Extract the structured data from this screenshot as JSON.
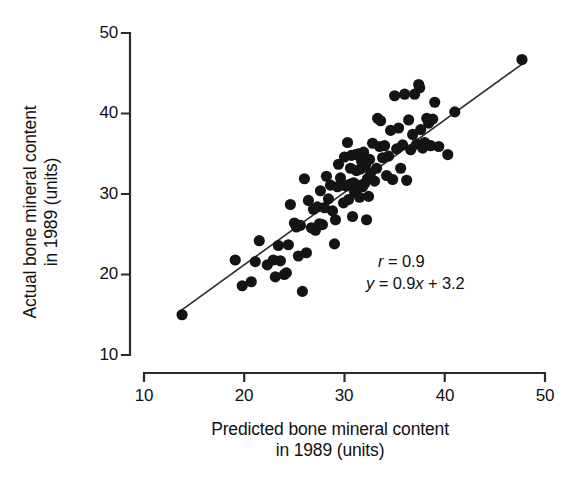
{
  "chart_data": {
    "type": "scatter",
    "title": "",
    "xlabel": "Predicted bone mineral content\nin 1989 (units)",
    "ylabel": "Actual bone mineral content\nin 1989 (units)",
    "xlim": [
      10,
      50
    ],
    "ylim": [
      10,
      50
    ],
    "xticks": [
      10,
      20,
      30,
      40,
      50
    ],
    "yticks": [
      10,
      20,
      30,
      40,
      50
    ],
    "xtick_labels": [
      "10",
      "20",
      "30",
      "40",
      "50"
    ],
    "ytick_labels": [
      "10",
      "20",
      "30",
      "40",
      "50"
    ],
    "grid": false,
    "legend": "none",
    "annotations": {
      "correlation_label": "r",
      "correlation_text": "r = 0.9",
      "correlation_value": 0.9,
      "equation_text": "y = 0.9x + 3.2",
      "equation_slope": 0.9,
      "equation_intercept": 3.2
    },
    "fit_line": {
      "type": "linear",
      "slope": 0.9,
      "intercept": 3.2,
      "x_start": 13.3,
      "x_end": 48.2,
      "color": "#2b2b2b"
    },
    "marker": {
      "shape": "circle",
      "color": "#141414",
      "size": 7.2
    },
    "points": [
      [
        13.8,
        15.0
      ],
      [
        19.1,
        21.8
      ],
      [
        19.8,
        18.6
      ],
      [
        20.7,
        19.1
      ],
      [
        21.1,
        21.6
      ],
      [
        21.5,
        24.2
      ],
      [
        22.3,
        21.2
      ],
      [
        22.9,
        21.8
      ],
      [
        23.1,
        19.7
      ],
      [
        23.4,
        23.6
      ],
      [
        23.6,
        21.7
      ],
      [
        24.0,
        20.0
      ],
      [
        24.2,
        20.2
      ],
      [
        24.4,
        23.7
      ],
      [
        24.6,
        28.7
      ],
      [
        25.0,
        26.4
      ],
      [
        25.2,
        25.9
      ],
      [
        25.4,
        22.3
      ],
      [
        25.6,
        26.1
      ],
      [
        25.8,
        17.9
      ],
      [
        26.0,
        31.9
      ],
      [
        26.2,
        22.7
      ],
      [
        26.4,
        29.2
      ],
      [
        26.7,
        25.8
      ],
      [
        26.9,
        28.1
      ],
      [
        27.1,
        25.5
      ],
      [
        27.3,
        28.4
      ],
      [
        27.5,
        26.3
      ],
      [
        27.6,
        30.4
      ],
      [
        27.8,
        26.2
      ],
      [
        28.0,
        28.3
      ],
      [
        28.2,
        32.2
      ],
      [
        28.4,
        29.4
      ],
      [
        28.6,
        31.1
      ],
      [
        28.8,
        27.9
      ],
      [
        29.0,
        23.8
      ],
      [
        29.1,
        26.8
      ],
      [
        29.3,
        30.9
      ],
      [
        29.4,
        33.7
      ],
      [
        29.6,
        32.0
      ],
      [
        29.8,
        31.1
      ],
      [
        29.9,
        28.9
      ],
      [
        30.0,
        34.6
      ],
      [
        30.2,
        31.0
      ],
      [
        30.3,
        36.4
      ],
      [
        30.4,
        29.3
      ],
      [
        30.5,
        31.2
      ],
      [
        30.6,
        33.2
      ],
      [
        30.7,
        34.8
      ],
      [
        30.8,
        27.2
      ],
      [
        30.9,
        31.4
      ],
      [
        31.0,
        30.2
      ],
      [
        31.1,
        34.9
      ],
      [
        31.2,
        32.9
      ],
      [
        31.3,
        31.1
      ],
      [
        31.4,
        35.0
      ],
      [
        31.5,
        29.6
      ],
      [
        31.6,
        33.1
      ],
      [
        31.7,
        34.1
      ],
      [
        31.8,
        30.9
      ],
      [
        31.9,
        35.2
      ],
      [
        32.0,
        31.3
      ],
      [
        32.1,
        33.6
      ],
      [
        32.2,
        26.8
      ],
      [
        32.3,
        31.9
      ],
      [
        32.4,
        29.7
      ],
      [
        32.5,
        34.3
      ],
      [
        32.6,
        32.6
      ],
      [
        32.8,
        36.3
      ],
      [
        33.0,
        31.6
      ],
      [
        33.2,
        33.2
      ],
      [
        33.3,
        39.4
      ],
      [
        33.5,
        35.9
      ],
      [
        33.6,
        39.1
      ],
      [
        33.8,
        34.5
      ],
      [
        34.0,
        36.0
      ],
      [
        34.2,
        32.3
      ],
      [
        34.4,
        34.7
      ],
      [
        34.6,
        37.9
      ],
      [
        34.8,
        31.8
      ],
      [
        35.0,
        42.2
      ],
      [
        35.2,
        35.6
      ],
      [
        35.4,
        38.2
      ],
      [
        35.6,
        33.2
      ],
      [
        35.8,
        36.1
      ],
      [
        36.0,
        42.4
      ],
      [
        36.2,
        31.7
      ],
      [
        36.4,
        39.2
      ],
      [
        36.6,
        35.5
      ],
      [
        36.8,
        37.4
      ],
      [
        37.0,
        42.4
      ],
      [
        37.2,
        36.2
      ],
      [
        37.4,
        43.6
      ],
      [
        37.5,
        43.2
      ],
      [
        37.6,
        38.0
      ],
      [
        37.8,
        35.7
      ],
      [
        38.0,
        36.4
      ],
      [
        38.2,
        39.4
      ],
      [
        38.4,
        38.8
      ],
      [
        38.6,
        36.0
      ],
      [
        38.8,
        39.3
      ],
      [
        39.0,
        41.4
      ],
      [
        39.4,
        35.9
      ],
      [
        40.3,
        34.9
      ],
      [
        41.0,
        40.2
      ],
      [
        47.7,
        46.7
      ]
    ]
  }
}
